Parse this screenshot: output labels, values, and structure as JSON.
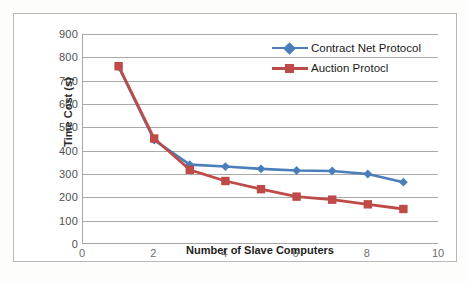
{
  "chart_data": {
    "type": "line",
    "title": "",
    "xlabel": "Number of Slave Computers",
    "ylabel": "Time Cost (s)",
    "xlim": [
      0,
      10
    ],
    "ylim": [
      0,
      900
    ],
    "xticks": [
      0,
      2,
      4,
      6,
      8,
      10
    ],
    "yticks": [
      0,
      100,
      200,
      300,
      400,
      500,
      600,
      700,
      800,
      900
    ],
    "grid": "horizontal",
    "legend_position": "inside-top-right",
    "x": [
      1,
      2,
      3,
      4,
      5,
      6,
      7,
      8,
      9
    ],
    "series": [
      {
        "name": "Contract Net Protocol",
        "color": "#4A7EBB",
        "marker": "diamond",
        "values": [
          760,
          445,
          340,
          332,
          322,
          315,
          313,
          300,
          265
        ]
      },
      {
        "name": "Auction Protocl",
        "color": "#BE4B48",
        "marker": "square",
        "values": [
          762,
          452,
          318,
          270,
          235,
          203,
          190,
          170,
          150
        ]
      }
    ]
  },
  "axes": {
    "y_tick_labels": [
      "900",
      "800",
      "700",
      "600",
      "500",
      "400",
      "300",
      "200",
      "100",
      "0"
    ],
    "x_tick_labels": [
      "0",
      "2",
      "4",
      "6",
      "8",
      "10"
    ],
    "y_title": "Time Cost (s)",
    "x_title": "Number of Slave Computers"
  },
  "legend": {
    "items": [
      {
        "label": "Contract Net Protocol",
        "color": "#4A7EBB",
        "marker": "diamond-marker"
      },
      {
        "label": "Auction Protocl",
        "color": "#BE4B48",
        "marker": "square-marker"
      }
    ]
  },
  "colors": {
    "series_blue": "#4A7EBB",
    "series_red": "#BE4B48",
    "gridline": "#A9A9A9",
    "axis": "#A6A6A6",
    "frame": "#B9B9B9",
    "tick_text": "#4F4F4F",
    "title_text": "#1E1E1E"
  }
}
